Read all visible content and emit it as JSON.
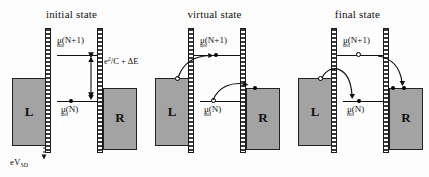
{
  "figure": {
    "type": "energy-level-diagram",
    "panels": [
      {
        "id": "initial",
        "title": "initial state",
        "left_reservoir_label": "L",
        "right_reservoir_label": "R",
        "levels": [
          {
            "name": "mu_N_plus_1",
            "label_mu": "μ",
            "label_sub": "dot",
            "label_arg": "(N+1)"
          },
          {
            "name": "mu_N",
            "label_mu": "μ",
            "label_sub": "dot",
            "label_arg": "(N)"
          }
        ],
        "energy_gap_label": "e",
        "energy_gap_sup": "2",
        "energy_gap_rest": "/C + ΔE",
        "bias_label_main": "eV",
        "bias_label_sub": "SD"
      },
      {
        "id": "virtual",
        "title": "virtual state",
        "left_reservoir_label": "L",
        "right_reservoir_label": "R",
        "levels": [
          {
            "name": "mu_N_plus_1",
            "label_mu": "μ",
            "label_sub": "dot",
            "label_arg": "(N+1)"
          },
          {
            "name": "mu_N",
            "label_mu": "μ",
            "label_sub": "dot",
            "label_arg": "(N)"
          }
        ]
      },
      {
        "id": "final",
        "title": "final state",
        "left_reservoir_label": "L",
        "right_reservoir_label": "R",
        "levels": [
          {
            "name": "mu_N_plus_1",
            "label_mu": "μ",
            "label_sub": "dot",
            "label_arg": "(N+1)"
          },
          {
            "name": "mu_N",
            "label_mu": "μ",
            "label_sub": "dot",
            "label_arg": "(N)"
          }
        ]
      }
    ],
    "colors": {
      "reservoir_fill": "#a3a3a3",
      "outline": "#111111",
      "background": "#fdfdfd"
    }
  }
}
